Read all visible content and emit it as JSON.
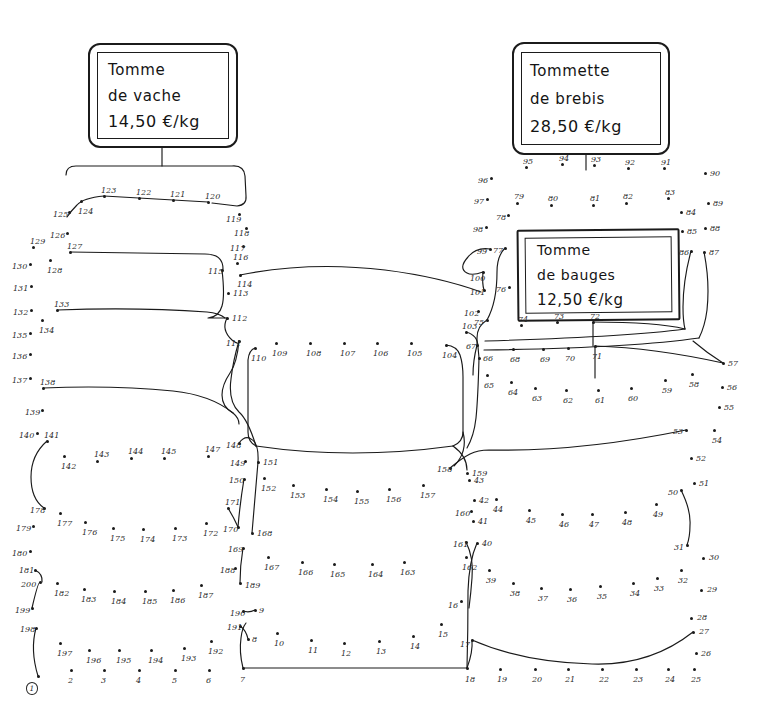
{
  "page": {
    "kind": "connect-the-dots-puzzle",
    "background_color": "#ffffff",
    "ink_color": "#1a1a1a",
    "label_color": "#2a2a2a",
    "width": 758,
    "height": 712,
    "total_dots": 200,
    "start_dot": 1
  },
  "signs": [
    {
      "id": "vache",
      "name": "price-sign-tomme-de-vache",
      "lines": [
        "Tomme",
        "de vache",
        "14,50 €/kg"
      ],
      "product": "Tomme de vache",
      "price": "14,50 €/kg"
    },
    {
      "id": "brebis",
      "name": "price-sign-tommette-de-brebis",
      "lines": [
        "Tommette",
        "de brebis",
        "28,50 €/kg"
      ],
      "product": "Tommette de brebis",
      "price": "28,50 €/kg"
    },
    {
      "id": "bauges",
      "name": "price-sign-tomme-de-bauges",
      "lines": [
        "Tomme",
        "de bauges",
        "12,50 €/kg"
      ],
      "product": "Tomme de bauges",
      "price": "12,50 €/kg"
    }
  ],
  "dots": [
    {
      "n": 1,
      "x": 38,
      "y": 676,
      "lx": -12,
      "ly": 6,
      "circled": true
    },
    {
      "n": 2,
      "x": 71,
      "y": 670,
      "lx": -3,
      "ly": 7
    },
    {
      "n": 3,
      "x": 104,
      "y": 670,
      "lx": -3,
      "ly": 7
    },
    {
      "n": 4,
      "x": 139,
      "y": 670,
      "lx": -3,
      "ly": 7
    },
    {
      "n": 5,
      "x": 175,
      "y": 670,
      "lx": -3,
      "ly": 7
    },
    {
      "n": 6,
      "x": 209,
      "y": 670,
      "lx": -3,
      "ly": 7
    },
    {
      "n": 7,
      "x": 243,
      "y": 668,
      "lx": -3,
      "ly": 8
    },
    {
      "n": 8,
      "x": 248,
      "y": 639,
      "lx": 4,
      "ly": -3
    },
    {
      "n": 9,
      "x": 255,
      "y": 610,
      "lx": 4,
      "ly": -3
    },
    {
      "n": 10,
      "x": 277,
      "y": 633,
      "lx": -3,
      "ly": 7
    },
    {
      "n": 11,
      "x": 311,
      "y": 640,
      "lx": -3,
      "ly": 7
    },
    {
      "n": 12,
      "x": 344,
      "y": 643,
      "lx": -3,
      "ly": 7
    },
    {
      "n": 13,
      "x": 379,
      "y": 641,
      "lx": -3,
      "ly": 7
    },
    {
      "n": 14,
      "x": 413,
      "y": 636,
      "lx": -3,
      "ly": 7
    },
    {
      "n": 15,
      "x": 441,
      "y": 624,
      "lx": -3,
      "ly": 7
    },
    {
      "n": 16,
      "x": 461,
      "y": 601,
      "lx": -13,
      "ly": 1
    },
    {
      "n": 17,
      "x": 472,
      "y": 640,
      "lx": -12,
      "ly": 1
    },
    {
      "n": 18,
      "x": 467,
      "y": 668,
      "lx": -2,
      "ly": 8
    },
    {
      "n": 19,
      "x": 500,
      "y": 669,
      "lx": -3,
      "ly": 7
    },
    {
      "n": 20,
      "x": 535,
      "y": 669,
      "lx": -3,
      "ly": 7
    },
    {
      "n": 21,
      "x": 568,
      "y": 669,
      "lx": -3,
      "ly": 7
    },
    {
      "n": 22,
      "x": 602,
      "y": 669,
      "lx": -3,
      "ly": 7
    },
    {
      "n": 23,
      "x": 636,
      "y": 669,
      "lx": -3,
      "ly": 7
    },
    {
      "n": 24,
      "x": 668,
      "y": 669,
      "lx": -3,
      "ly": 7
    },
    {
      "n": 25,
      "x": 694,
      "y": 669,
      "lx": -3,
      "ly": 7
    },
    {
      "n": 26,
      "x": 696,
      "y": 653,
      "lx": 5,
      "ly": -3
    },
    {
      "n": 27,
      "x": 693,
      "y": 632,
      "lx": 6,
      "ly": -4
    },
    {
      "n": 28,
      "x": 691,
      "y": 618,
      "lx": 6,
      "ly": -4
    },
    {
      "n": 29,
      "x": 701,
      "y": 590,
      "lx": 6,
      "ly": -4
    },
    {
      "n": 30,
      "x": 703,
      "y": 558,
      "lx": 6,
      "ly": -4
    },
    {
      "n": 31,
      "x": 687,
      "y": 545,
      "lx": -13,
      "ly": -1
    },
    {
      "n": 32,
      "x": 681,
      "y": 570,
      "lx": -3,
      "ly": 7
    },
    {
      "n": 33,
      "x": 657,
      "y": 578,
      "lx": -3,
      "ly": 7
    },
    {
      "n": 34,
      "x": 633,
      "y": 583,
      "lx": -3,
      "ly": 7
    },
    {
      "n": 35,
      "x": 600,
      "y": 586,
      "lx": -3,
      "ly": 7
    },
    {
      "n": 36,
      "x": 570,
      "y": 589,
      "lx": -3,
      "ly": 7
    },
    {
      "n": 37,
      "x": 541,
      "y": 588,
      "lx": -3,
      "ly": 7
    },
    {
      "n": 38,
      "x": 513,
      "y": 583,
      "lx": -3,
      "ly": 7
    },
    {
      "n": 39,
      "x": 489,
      "y": 570,
      "lx": -3,
      "ly": 7
    },
    {
      "n": 40,
      "x": 477,
      "y": 543,
      "lx": 5,
      "ly": -3
    },
    {
      "n": 41,
      "x": 473,
      "y": 521,
      "lx": 5,
      "ly": -3
    },
    {
      "n": 42,
      "x": 474,
      "y": 500,
      "lx": 5,
      "ly": -3
    },
    {
      "n": 43,
      "x": 469,
      "y": 480,
      "lx": 5,
      "ly": -3
    },
    {
      "n": 44,
      "x": 496,
      "y": 499,
      "lx": -3,
      "ly": 7
    },
    {
      "n": 45,
      "x": 529,
      "y": 510,
      "lx": -3,
      "ly": 7
    },
    {
      "n": 46,
      "x": 562,
      "y": 514,
      "lx": -3,
      "ly": 7
    },
    {
      "n": 47,
      "x": 592,
      "y": 514,
      "lx": -3,
      "ly": 7
    },
    {
      "n": 48,
      "x": 625,
      "y": 512,
      "lx": -3,
      "ly": 7
    },
    {
      "n": 49,
      "x": 656,
      "y": 504,
      "lx": -3,
      "ly": 7
    },
    {
      "n": 50,
      "x": 681,
      "y": 490,
      "lx": -13,
      "ly": -1
    },
    {
      "n": 51,
      "x": 694,
      "y": 483,
      "lx": 5,
      "ly": -3
    },
    {
      "n": 52,
      "x": 691,
      "y": 458,
      "lx": 5,
      "ly": -3
    },
    {
      "n": 53,
      "x": 686,
      "y": 430,
      "lx": -13,
      "ly": -2
    },
    {
      "n": 54,
      "x": 714,
      "y": 430,
      "lx": -2,
      "ly": 7
    },
    {
      "n": 55,
      "x": 719,
      "y": 407,
      "lx": 5,
      "ly": -3
    },
    {
      "n": 56,
      "x": 722,
      "y": 387,
      "lx": 5,
      "ly": -3
    },
    {
      "n": 57,
      "x": 723,
      "y": 363,
      "lx": 5,
      "ly": -3
    },
    {
      "n": 58,
      "x": 692,
      "y": 374,
      "lx": -3,
      "ly": 7
    },
    {
      "n": 59,
      "x": 665,
      "y": 380,
      "lx": -3,
      "ly": 7
    },
    {
      "n": 60,
      "x": 631,
      "y": 388,
      "lx": -3,
      "ly": 7
    },
    {
      "n": 61,
      "x": 598,
      "y": 390,
      "lx": -3,
      "ly": 7
    },
    {
      "n": 62,
      "x": 566,
      "y": 390,
      "lx": -3,
      "ly": 7
    },
    {
      "n": 63,
      "x": 535,
      "y": 388,
      "lx": -3,
      "ly": 7
    },
    {
      "n": 64,
      "x": 511,
      "y": 382,
      "lx": -3,
      "ly": 7
    },
    {
      "n": 65,
      "x": 487,
      "y": 375,
      "lx": -3,
      "ly": 7
    },
    {
      "n": 66,
      "x": 479,
      "y": 358,
      "lx": 4,
      "ly": -3
    },
    {
      "n": 67,
      "x": 477,
      "y": 345,
      "lx": -11,
      "ly": -2
    },
    {
      "n": 68,
      "x": 513,
      "y": 349,
      "lx": -3,
      "ly": 7
    },
    {
      "n": 69,
      "x": 543,
      "y": 349,
      "lx": -3,
      "ly": 7
    },
    {
      "n": 70,
      "x": 568,
      "y": 348,
      "lx": -3,
      "ly": 7
    },
    {
      "n": 71,
      "x": 595,
      "y": 346,
      "lx": -3,
      "ly": 7
    },
    {
      "n": 72,
      "x": 593,
      "y": 322,
      "lx": -3,
      "ly": -9
    },
    {
      "n": 73,
      "x": 557,
      "y": 322,
      "lx": -3,
      "ly": -9
    },
    {
      "n": 74,
      "x": 521,
      "y": 325,
      "lx": -3,
      "ly": -9
    },
    {
      "n": 75,
      "x": 487,
      "y": 320,
      "lx": -13,
      "ly": -1
    },
    {
      "n": 76,
      "x": 509,
      "y": 287,
      "lx": -13,
      "ly": -1
    },
    {
      "n": 77,
      "x": 505,
      "y": 248,
      "lx": -12,
      "ly": -1
    },
    {
      "n": 78,
      "x": 508,
      "y": 215,
      "lx": -12,
      "ly": -1
    },
    {
      "n": 79,
      "x": 517,
      "y": 203,
      "lx": -3,
      "ly": -10
    },
    {
      "n": 80,
      "x": 551,
      "y": 205,
      "lx": -3,
      "ly": -10
    },
    {
      "n": 81,
      "x": 593,
      "y": 205,
      "lx": -3,
      "ly": -10
    },
    {
      "n": 82,
      "x": 626,
      "y": 203,
      "lx": -3,
      "ly": -10
    },
    {
      "n": 83,
      "x": 668,
      "y": 198,
      "lx": -3,
      "ly": -9
    },
    {
      "n": 84,
      "x": 681,
      "y": 212,
      "lx": 5,
      "ly": -3
    },
    {
      "n": 85,
      "x": 682,
      "y": 231,
      "lx": 5,
      "ly": -3
    },
    {
      "n": 86,
      "x": 691,
      "y": 251,
      "lx": -12,
      "ly": -2
    },
    {
      "n": 87,
      "x": 704,
      "y": 252,
      "lx": 5,
      "ly": -3
    },
    {
      "n": 88,
      "x": 705,
      "y": 228,
      "lx": 5,
      "ly": -3
    },
    {
      "n": 89,
      "x": 708,
      "y": 203,
      "lx": 5,
      "ly": -3
    },
    {
      "n": 90,
      "x": 705,
      "y": 173,
      "lx": 5,
      "ly": -3
    },
    {
      "n": 91,
      "x": 664,
      "y": 168,
      "lx": -3,
      "ly": -9
    },
    {
      "n": 92,
      "x": 628,
      "y": 168,
      "lx": -3,
      "ly": -9
    },
    {
      "n": 93,
      "x": 594,
      "y": 165,
      "lx": -3,
      "ly": -9
    },
    {
      "n": 94,
      "x": 562,
      "y": 164,
      "lx": -3,
      "ly": -9
    },
    {
      "n": 95,
      "x": 526,
      "y": 167,
      "lx": -3,
      "ly": -9
    },
    {
      "n": 96,
      "x": 491,
      "y": 178,
      "lx": -13,
      "ly": -1
    },
    {
      "n": 97,
      "x": 487,
      "y": 199,
      "lx": -13,
      "ly": -1
    },
    {
      "n": 98,
      "x": 486,
      "y": 227,
      "lx": -13,
      "ly": -1
    },
    {
      "n": 99,
      "x": 490,
      "y": 249,
      "lx": -13,
      "ly": -1
    },
    {
      "n": 100,
      "x": 483,
      "y": 272,
      "lx": -13,
      "ly": 3
    },
    {
      "n": 101,
      "x": 484,
      "y": 290,
      "lx": -14,
      "ly": -1
    },
    {
      "n": 102,
      "x": 478,
      "y": 311,
      "lx": -14,
      "ly": -1
    },
    {
      "n": 103,
      "x": 466,
      "y": 332,
      "lx": -4,
      "ly": -9
    },
    {
      "n": 104,
      "x": 446,
      "y": 345,
      "lx": -4,
      "ly": 7
    },
    {
      "n": 105,
      "x": 411,
      "y": 343,
      "lx": -4,
      "ly": 7
    },
    {
      "n": 106,
      "x": 377,
      "y": 343,
      "lx": -4,
      "ly": 7
    },
    {
      "n": 107,
      "x": 344,
      "y": 343,
      "lx": -4,
      "ly": 7
    },
    {
      "n": 108,
      "x": 310,
      "y": 343,
      "lx": -4,
      "ly": 7
    },
    {
      "n": 109,
      "x": 276,
      "y": 343,
      "lx": -4,
      "ly": 7
    },
    {
      "n": 110,
      "x": 255,
      "y": 348,
      "lx": -4,
      "ly": 7
    },
    {
      "n": 111,
      "x": 239,
      "y": 341,
      "lx": -13,
      "ly": -1
    },
    {
      "n": 112,
      "x": 227,
      "y": 318,
      "lx": 5,
      "ly": -3
    },
    {
      "n": 113,
      "x": 228,
      "y": 293,
      "lx": 5,
      "ly": -3
    },
    {
      "n": 114,
      "x": 240,
      "y": 275,
      "lx": -3,
      "ly": 6
    },
    {
      "n": 115,
      "x": 222,
      "y": 270,
      "lx": -14,
      "ly": -2
    },
    {
      "n": 116,
      "x": 237,
      "y": 263,
      "lx": -4,
      "ly": -9
    },
    {
      "n": 117,
      "x": 243,
      "y": 246,
      "lx": -13,
      "ly": -1
    },
    {
      "n": 118,
      "x": 246,
      "y": 228,
      "lx": -12,
      "ly": 2
    },
    {
      "n": 119,
      "x": 239,
      "y": 214,
      "lx": -13,
      "ly": 2
    },
    {
      "n": 120,
      "x": 208,
      "y": 202,
      "lx": -3,
      "ly": -9
    },
    {
      "n": 121,
      "x": 173,
      "y": 200,
      "lx": -3,
      "ly": -9
    },
    {
      "n": 122,
      "x": 139,
      "y": 198,
      "lx": -3,
      "ly": -9
    },
    {
      "n": 123,
      "x": 104,
      "y": 196,
      "lx": -3,
      "ly": -9
    },
    {
      "n": 124,
      "x": 81,
      "y": 201,
      "lx": -3,
      "ly": 7
    },
    {
      "n": 125,
      "x": 69,
      "y": 212,
      "lx": -16,
      "ly": -1
    },
    {
      "n": 126,
      "x": 67,
      "y": 233,
      "lx": -17,
      "ly": -1
    },
    {
      "n": 127,
      "x": 70,
      "y": 252,
      "lx": -3,
      "ly": -9
    },
    {
      "n": 128,
      "x": 50,
      "y": 260,
      "lx": -3,
      "ly": 7
    },
    {
      "n": 129,
      "x": 33,
      "y": 247,
      "lx": -3,
      "ly": -9
    },
    {
      "n": 130,
      "x": 30,
      "y": 264,
      "lx": -18,
      "ly": -1
    },
    {
      "n": 131,
      "x": 31,
      "y": 286,
      "lx": -18,
      "ly": -1
    },
    {
      "n": 132,
      "x": 31,
      "y": 310,
      "lx": -18,
      "ly": -1
    },
    {
      "n": 133,
      "x": 57,
      "y": 310,
      "lx": -3,
      "ly": -9
    },
    {
      "n": 134,
      "x": 42,
      "y": 320,
      "lx": -3,
      "ly": 7
    },
    {
      "n": 135,
      "x": 30,
      "y": 333,
      "lx": -18,
      "ly": -1
    },
    {
      "n": 136,
      "x": 30,
      "y": 354,
      "lx": -18,
      "ly": -1
    },
    {
      "n": 137,
      "x": 30,
      "y": 378,
      "lx": -18,
      "ly": -1
    },
    {
      "n": 138,
      "x": 43,
      "y": 388,
      "lx": -3,
      "ly": -9
    },
    {
      "n": 139,
      "x": 42,
      "y": 410,
      "lx": -17,
      "ly": -1
    },
    {
      "n": 140,
      "x": 37,
      "y": 433,
      "lx": -18,
      "ly": -1
    },
    {
      "n": 141,
      "x": 47,
      "y": 441,
      "lx": -3,
      "ly": -9
    },
    {
      "n": 142,
      "x": 64,
      "y": 456,
      "lx": -3,
      "ly": 7
    },
    {
      "n": 143,
      "x": 97,
      "y": 461,
      "lx": -3,
      "ly": -10
    },
    {
      "n": 144,
      "x": 131,
      "y": 458,
      "lx": -3,
      "ly": -10
    },
    {
      "n": 145,
      "x": 164,
      "y": 458,
      "lx": -3,
      "ly": -10
    },
    {
      "n": 146,
      "x": 164,
      "y": 458,
      "lx": -3,
      "ly": -10,
      "hidden": true
    },
    {
      "n": 147,
      "x": 208,
      "y": 456,
      "lx": -3,
      "ly": -10
    },
    {
      "n": 148,
      "x": 239,
      "y": 443,
      "lx": -13,
      "ly": -1
    },
    {
      "n": 149,
      "x": 245,
      "y": 461,
      "lx": -15,
      "ly": -1
    },
    {
      "n": 150,
      "x": 244,
      "y": 479,
      "lx": -15,
      "ly": -2
    },
    {
      "n": 151,
      "x": 258,
      "y": 462,
      "lx": 5,
      "ly": -3
    },
    {
      "n": 152,
      "x": 264,
      "y": 478,
      "lx": -3,
      "ly": 7
    },
    {
      "n": 153,
      "x": 293,
      "y": 485,
      "lx": -3,
      "ly": 7
    },
    {
      "n": 154,
      "x": 326,
      "y": 489,
      "lx": -3,
      "ly": 7
    },
    {
      "n": 155,
      "x": 357,
      "y": 491,
      "lx": -3,
      "ly": 7
    },
    {
      "n": 156,
      "x": 389,
      "y": 489,
      "lx": -3,
      "ly": 7
    },
    {
      "n": 157,
      "x": 423,
      "y": 485,
      "lx": -3,
      "ly": 7
    },
    {
      "n": 158,
      "x": 450,
      "y": 468,
      "lx": -13,
      "ly": -2
    },
    {
      "n": 159,
      "x": 467,
      "y": 473,
      "lx": 5,
      "ly": -3
    },
    {
      "n": 160,
      "x": 471,
      "y": 511,
      "lx": -16,
      "ly": -1
    },
    {
      "n": 161,
      "x": 466,
      "y": 542,
      "lx": -13,
      "ly": -1
    },
    {
      "n": 162,
      "x": 466,
      "y": 557,
      "lx": -4,
      "ly": 7
    },
    {
      "n": 163,
      "x": 404,
      "y": 562,
      "lx": -4,
      "ly": 7
    },
    {
      "n": 164,
      "x": 372,
      "y": 564,
      "lx": -4,
      "ly": 7
    },
    {
      "n": 165,
      "x": 334,
      "y": 564,
      "lx": -4,
      "ly": 7
    },
    {
      "n": 166,
      "x": 302,
      "y": 562,
      "lx": -4,
      "ly": 7
    },
    {
      "n": 167,
      "x": 268,
      "y": 557,
      "lx": -4,
      "ly": 7
    },
    {
      "n": 168,
      "x": 252,
      "y": 533,
      "lx": 5,
      "ly": -3
    },
    {
      "n": 169,
      "x": 243,
      "y": 548,
      "lx": -15,
      "ly": -2
    },
    {
      "n": 170,
      "x": 238,
      "y": 527,
      "lx": -15,
      "ly": -1
    },
    {
      "n": 171,
      "x": 228,
      "y": 508,
      "lx": -3,
      "ly": -9
    },
    {
      "n": 172,
      "x": 206,
      "y": 523,
      "lx": -3,
      "ly": 7
    },
    {
      "n": 173,
      "x": 175,
      "y": 528,
      "lx": -3,
      "ly": 7
    },
    {
      "n": 174,
      "x": 143,
      "y": 529,
      "lx": -3,
      "ly": 7
    },
    {
      "n": 175,
      "x": 113,
      "y": 528,
      "lx": -3,
      "ly": 7
    },
    {
      "n": 176,
      "x": 85,
      "y": 522,
      "lx": -3,
      "ly": 7
    },
    {
      "n": 177,
      "x": 60,
      "y": 513,
      "lx": -3,
      "ly": 7
    },
    {
      "n": 178,
      "x": 44,
      "y": 508,
      "lx": -14,
      "ly": -1
    },
    {
      "n": 179,
      "x": 33,
      "y": 526,
      "lx": -17,
      "ly": -1
    },
    {
      "n": 180,
      "x": 30,
      "y": 551,
      "lx": -18,
      "ly": -1
    },
    {
      "n": 181,
      "x": 35,
      "y": 570,
      "lx": -16,
      "ly": -3
    },
    {
      "n": 182,
      "x": 57,
      "y": 583,
      "lx": -3,
      "ly": 7
    },
    {
      "n": 183,
      "x": 84,
      "y": 589,
      "lx": -3,
      "ly": 7
    },
    {
      "n": 184,
      "x": 114,
      "y": 591,
      "lx": -3,
      "ly": 7
    },
    {
      "n": 185,
      "x": 145,
      "y": 591,
      "lx": -3,
      "ly": 7
    },
    {
      "n": 186,
      "x": 173,
      "y": 590,
      "lx": -3,
      "ly": 7
    },
    {
      "n": 187,
      "x": 201,
      "y": 585,
      "lx": -3,
      "ly": 7
    },
    {
      "n": 188,
      "x": 235,
      "y": 568,
      "lx": -15,
      "ly": -1
    },
    {
      "n": 189,
      "x": 240,
      "y": 583,
      "lx": 5,
      "ly": -1
    },
    {
      "n": 190,
      "x": 243,
      "y": 611,
      "lx": -13,
      "ly": -1
    },
    {
      "n": 191,
      "x": 240,
      "y": 626,
      "lx": -13,
      "ly": -2
    },
    {
      "n": 192,
      "x": 211,
      "y": 641,
      "lx": -3,
      "ly": 7
    },
    {
      "n": 193,
      "x": 184,
      "y": 648,
      "lx": -3,
      "ly": 7
    },
    {
      "n": 194,
      "x": 151,
      "y": 650,
      "lx": -3,
      "ly": 7
    },
    {
      "n": 195,
      "x": 119,
      "y": 650,
      "lx": -3,
      "ly": 7
    },
    {
      "n": 196,
      "x": 89,
      "y": 650,
      "lx": -3,
      "ly": 7
    },
    {
      "n": 197,
      "x": 60,
      "y": 643,
      "lx": -3,
      "ly": 7
    },
    {
      "n": 198,
      "x": 36,
      "y": 628,
      "lx": -16,
      "ly": -2
    },
    {
      "n": 199,
      "x": 32,
      "y": 608,
      "lx": -17,
      "ly": -1
    },
    {
      "n": 200,
      "x": 40,
      "y": 582,
      "lx": -19,
      "ly": -1
    }
  ]
}
